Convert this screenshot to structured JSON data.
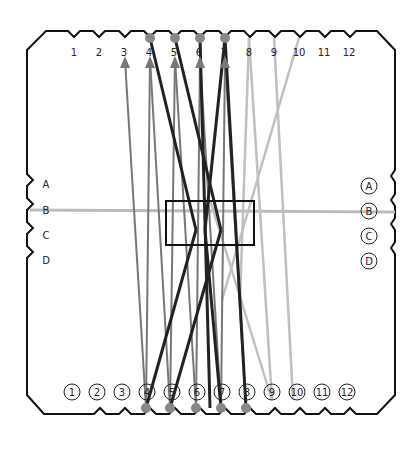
{
  "diagram": {
    "title": "",
    "top_labels": [
      "1",
      "2",
      "3",
      "4",
      "5",
      "6",
      "7",
      "8",
      "9",
      "10",
      "11",
      "12"
    ],
    "bottom_labels": [
      "1",
      "2",
      "3",
      "4",
      "5",
      "6",
      "7",
      "8",
      "9",
      "10",
      "11",
      "12"
    ],
    "left_labels": [
      "A",
      "B",
      "C",
      "D"
    ],
    "right_labels": [
      "A",
      "B",
      "C",
      "D"
    ],
    "colors": {
      "outline": "#111111",
      "dark_line": "#222222",
      "mid_line": "#777777",
      "light_line": "#bbbbbb",
      "peg": "#888888"
    }
  }
}
